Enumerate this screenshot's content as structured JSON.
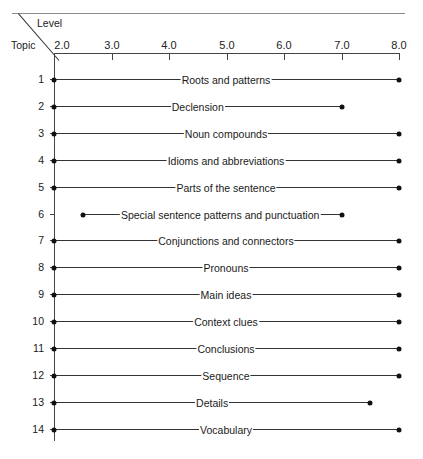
{
  "chart_data": {
    "type": "range-bar",
    "title": "",
    "xlabel": "Level",
    "ylabel": "Topic",
    "xlim": [
      2.0,
      8.0
    ],
    "x_ticks": [
      "2.0",
      "3.0",
      "4.0",
      "5.0",
      "6.0",
      "7.0",
      "8.0"
    ],
    "grid": false,
    "rows": [
      {
        "topic": "1",
        "label": "Roots and patterns",
        "start": 2.0,
        "end": 8.0
      },
      {
        "topic": "2",
        "label": "Declension",
        "start": 2.0,
        "end": 7.0
      },
      {
        "topic": "3",
        "label": "Noun compounds",
        "start": 2.0,
        "end": 8.0
      },
      {
        "topic": "4",
        "label": "Idioms and abbreviations",
        "start": 2.0,
        "end": 8.0
      },
      {
        "topic": "5",
        "label": "Parts of the sentence",
        "start": 2.0,
        "end": 8.0
      },
      {
        "topic": "6",
        "label": "Special sentence patterns and punctuation",
        "start": 2.5,
        "end": 7.0
      },
      {
        "topic": "7",
        "label": "Conjunctions and connectors",
        "start": 2.0,
        "end": 8.0
      },
      {
        "topic": "8",
        "label": "Pronouns",
        "start": 2.0,
        "end": 8.0
      },
      {
        "topic": "9",
        "label": "Main ideas",
        "start": 2.0,
        "end": 8.0
      },
      {
        "topic": "10",
        "label": "Context clues",
        "start": 2.0,
        "end": 8.0
      },
      {
        "topic": "11",
        "label": "Conclusions",
        "start": 2.0,
        "end": 8.0
      },
      {
        "topic": "12",
        "label": "Sequence",
        "start": 2.0,
        "end": 8.0
      },
      {
        "topic": "13",
        "label": "Details",
        "start": 2.0,
        "end": 7.5
      },
      {
        "topic": "14",
        "label": "Vocabulary",
        "start": 2.0,
        "end": 8.0
      }
    ]
  },
  "header": {
    "level_label": "Level",
    "topic_label": "Topic"
  },
  "colors": {
    "line": "#333333",
    "dot": "#111111",
    "axis": "#444444"
  }
}
